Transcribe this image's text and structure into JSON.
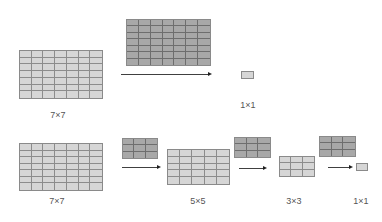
{
  "colors": {
    "input_fill": "#d6d6d6",
    "kernel_fill": "#a8a8a8",
    "grid_line": "#7a7a7a",
    "arrow": "#404040",
    "label": "#555555"
  },
  "top_row": {
    "description": "Single 7x7 convolution",
    "input": {
      "label": "7×7",
      "rows": 7,
      "cols": 7
    },
    "kernel": {
      "rows": 7,
      "cols": 7
    },
    "output": {
      "label": "1×1",
      "rows": 1,
      "cols": 1
    }
  },
  "bottom_row": {
    "description": "Three stacked 3x3 convolutions",
    "input": {
      "label": "7×7",
      "rows": 7,
      "cols": 7
    },
    "stages": [
      {
        "kernel": {
          "rows": 3,
          "cols": 3
        },
        "output": {
          "label": "5×5",
          "rows": 5,
          "cols": 5
        }
      },
      {
        "kernel": {
          "rows": 3,
          "cols": 3
        },
        "output": {
          "label": "3×3",
          "rows": 3,
          "cols": 3
        }
      },
      {
        "kernel": {
          "rows": 3,
          "cols": 3
        },
        "output": {
          "label": "1×1",
          "rows": 1,
          "cols": 1
        }
      }
    ]
  }
}
